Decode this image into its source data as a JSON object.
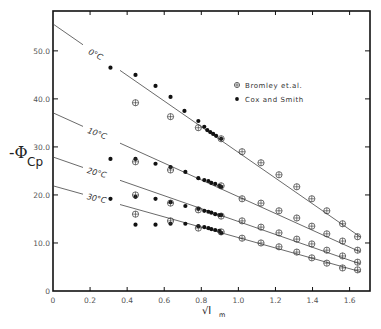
{
  "chart_data": {
    "type": "scatter",
    "title": "",
    "xlabel": "√I_m",
    "ylabel": "-Φ_Cp",
    "xlim": [
      0,
      1.71
    ],
    "ylim": [
      0,
      58.3
    ],
    "x_ticks": [
      "0",
      "0.2",
      "0.4",
      "0.6",
      "0.8",
      "1.0",
      "1.2",
      "1.4",
      "1.6"
    ],
    "x_tick_values": [
      0,
      0.2,
      0.4,
      0.6,
      0.8,
      1.0,
      1.2,
      1.4,
      1.6
    ],
    "y_ticks": [
      "0",
      "10.0",
      "20.0",
      "30.0",
      "40.0",
      "50.0"
    ],
    "y_tick_values": [
      0,
      10,
      20,
      30,
      40,
      50
    ],
    "grid": false,
    "legend_position": "upper-right",
    "legend": [
      {
        "name": "Bromley et.al.",
        "marker": "circle-plus"
      },
      {
        "name": "Cox and Smith",
        "marker": "filled-circle"
      }
    ],
    "fit_lines": [
      {
        "label": "0°C",
        "x": [
          0,
          1.66
        ],
        "y": [
          55.6,
          11.2
        ]
      },
      {
        "label": "10°C",
        "x": [
          0,
          1.66
        ],
        "y": [
          37.1,
          8.1
        ]
      },
      {
        "label": "20°C",
        "x": [
          0,
          1.66
        ],
        "y": [
          27.9,
          5.6
        ]
      },
      {
        "label": "30°C",
        "x": [
          0,
          1.66
        ],
        "y": [
          21.9,
          4.0
        ]
      }
    ],
    "series": [
      {
        "name": "Cox and Smith",
        "temperature": "0°C",
        "marker": "filled-circle",
        "x": [
          0.31,
          0.445,
          0.553,
          0.634,
          0.709,
          0.784,
          0.816,
          0.832,
          0.848,
          0.864,
          0.88,
          0.907
        ],
        "y": [
          46.5,
          45.0,
          42.7,
          40.4,
          37.5,
          35.4,
          34.2,
          33.5,
          33.1,
          32.7,
          32.3,
          31.7
        ]
      },
      {
        "name": "Bromley et.al.",
        "temperature": "0°C",
        "marker": "circle-plus",
        "x": [
          0.445,
          0.634,
          0.784,
          0.907,
          1.02,
          1.122,
          1.219,
          1.315,
          1.396,
          1.477,
          1.562,
          1.643
        ],
        "y": [
          39.2,
          36.3,
          34.0,
          31.7,
          29.0,
          26.7,
          24.2,
          21.7,
          19.2,
          16.7,
          14.0,
          11.3
        ]
      },
      {
        "name": "Cox and Smith",
        "temperature": "10°C",
        "marker": "filled-circle",
        "x": [
          0.31,
          0.445,
          0.553,
          0.634,
          0.714,
          0.784,
          0.816,
          0.838,
          0.854,
          0.875,
          0.897,
          0.907
        ],
        "y": [
          27.5,
          27.5,
          26.5,
          25.8,
          24.8,
          23.5,
          23.1,
          22.9,
          22.5,
          22.3,
          21.9,
          21.7
        ]
      },
      {
        "name": "Bromley et.al.",
        "temperature": "10°C",
        "marker": "circle-plus",
        "x": [
          0.445,
          0.634,
          0.907,
          1.02,
          1.122,
          1.219,
          1.315,
          1.396,
          1.477,
          1.562,
          1.643
        ],
        "y": [
          26.9,
          25.2,
          21.9,
          19.2,
          18.3,
          16.7,
          15.2,
          13.5,
          11.9,
          10.4,
          8.5
        ]
      },
      {
        "name": "Cox and Smith",
        "temperature": "20°C",
        "marker": "filled-circle",
        "x": [
          0.31,
          0.445,
          0.553,
          0.634,
          0.714,
          0.784,
          0.816,
          0.838,
          0.854,
          0.875,
          0.897,
          0.907
        ],
        "y": [
          19.2,
          19.6,
          19.2,
          18.5,
          17.7,
          17.1,
          16.7,
          16.5,
          16.3,
          16.0,
          15.8,
          15.8
        ]
      },
      {
        "name": "Bromley et.al.",
        "temperature": "20°C",
        "marker": "circle-plus",
        "x": [
          0.445,
          0.634,
          0.784,
          0.907,
          1.02,
          1.122,
          1.219,
          1.315,
          1.396,
          1.477,
          1.562,
          1.643
        ],
        "y": [
          20.0,
          18.3,
          16.9,
          15.6,
          14.6,
          13.3,
          12.1,
          10.8,
          9.8,
          8.5,
          7.3,
          6.0
        ]
      },
      {
        "name": "Cox and Smith",
        "temperature": "30°C",
        "marker": "filled-circle",
        "x": [
          0.445,
          0.553,
          0.634,
          0.714,
          0.784,
          0.816,
          0.838,
          0.854,
          0.875,
          0.897,
          0.907
        ],
        "y": [
          13.8,
          13.8,
          14.0,
          14.0,
          13.5,
          13.3,
          13.1,
          12.9,
          12.7,
          12.5,
          12.1
        ]
      },
      {
        "name": "Bromley et.al.",
        "temperature": "30°C",
        "marker": "circle-plus",
        "x": [
          0.445,
          0.634,
          0.784,
          0.907,
          1.02,
          1.122,
          1.219,
          1.315,
          1.396,
          1.477,
          1.562,
          1.643
        ],
        "y": [
          16.0,
          14.6,
          13.1,
          12.3,
          11.0,
          10.0,
          9.2,
          8.1,
          6.9,
          5.8,
          4.8,
          4.4
        ]
      }
    ]
  },
  "labels": {
    "ylabel_main": "-Φ",
    "ylabel_sub": "Cp",
    "xlabel_main": "√I",
    "xlabel_sub": "m",
    "legend_bromley": "Bromley et.al.",
    "legend_cox": "Cox and Smith"
  }
}
